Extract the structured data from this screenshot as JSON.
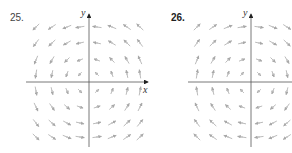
{
  "figures": [
    {
      "id": "25",
      "label": "25.",
      "x_axis_label": "x",
      "y_axis_label": "y",
      "origin": [
        89,
        82
      ],
      "x_range": [
        26,
        148
      ],
      "y_range": [
        14,
        147
      ],
      "arrow_color": "#b3b3b3",
      "columns": [
        36,
        52,
        67,
        80,
        97,
        112,
        127,
        140
      ],
      "rows": [
        27,
        43,
        60,
        74,
        91,
        107,
        123,
        137
      ],
      "rotation": "counterclockwise"
    },
    {
      "id": "26",
      "label": "26.",
      "x_axis_label": "",
      "y_axis_label": "y",
      "origin": [
        251,
        82
      ],
      "x_range": [
        188,
        292
      ],
      "y_range": [
        14,
        147
      ],
      "arrow_color": "#b3b3b3",
      "columns": [
        197,
        213,
        228,
        242,
        259,
        273,
        287
      ],
      "rows": [
        27,
        43,
        60,
        74,
        91,
        107,
        123,
        137
      ],
      "rotation": "clockwise"
    }
  ],
  "chart_data": [
    {
      "type": "vector_field",
      "title": "25.",
      "xlabel": "x",
      "ylabel": "y",
      "description": "Counterclockwise rotational field: upper-left arrows point down, upper-right point left, lower-left point right, lower-right point up",
      "grid": false
    },
    {
      "type": "vector_field",
      "title": "26.",
      "xlabel": "x",
      "ylabel": "y",
      "description": "Clockwise rotational field: upper-left arrows point right, upper-right point up, lower-right point left, lower-left point down",
      "grid": false
    }
  ]
}
